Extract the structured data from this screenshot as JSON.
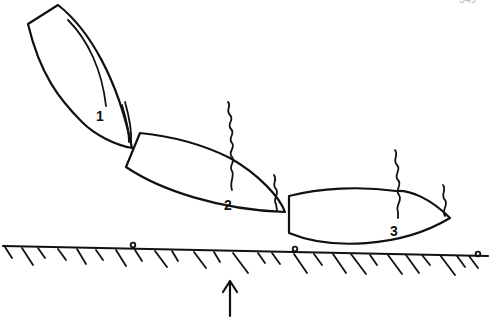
{
  "page_number": "349",
  "diagram": {
    "type": "boat-docking-sequence",
    "positions": [
      {
        "id": 1,
        "label": "1"
      },
      {
        "id": 2,
        "label": "2"
      },
      {
        "id": 3,
        "label": "3"
      }
    ],
    "elements": [
      "boat-outline",
      "mooring-line",
      "quay-edge",
      "bollard",
      "direction-arrow"
    ],
    "colors": {
      "line": "#111111",
      "background": "#ffffff"
    }
  }
}
